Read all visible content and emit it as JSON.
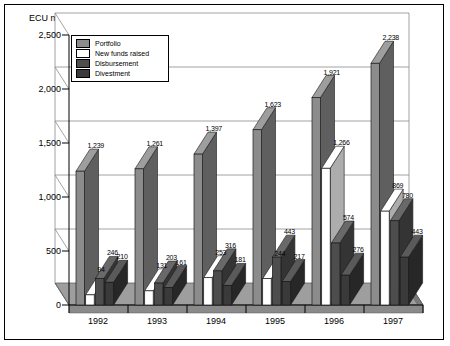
{
  "chart_data": {
    "type": "bar",
    "title": "",
    "ylabel": "ECU million",
    "xlabel": "",
    "categories": [
      "1992",
      "1993",
      "1994",
      "1995",
      "1996",
      "1997"
    ],
    "yticks": [
      "0",
      "500",
      "1,000",
      "1,500",
      "2,000",
      "2,500"
    ],
    "ytick_values": [
      0,
      500,
      1000,
      1500,
      2000,
      2500
    ],
    "ylim": [
      0,
      2500
    ],
    "grid": true,
    "legend_position": "top-left-inside",
    "style": "3d-grouped-bar",
    "series": [
      {
        "name": "Portfolio",
        "color": "#8c8c8c",
        "values": [
          1239,
          1261,
          1397,
          1623,
          1921,
          2238
        ],
        "labels": [
          "1,239",
          "1,261",
          "1,397",
          "1,623",
          "1,921",
          "2,238"
        ]
      },
      {
        "name": "New funds raised",
        "color": "#ffffff",
        "values": [
          94,
          131,
          253,
          244,
          1266,
          869
        ],
        "labels": [
          "94",
          "131",
          "253",
          "244",
          "1,266",
          "869"
        ]
      },
      {
        "name": "Disbursement",
        "color": "#4d4d4d",
        "values": [
          246,
          203,
          316,
          443,
          574,
          780
        ],
        "labels": [
          "246",
          "203",
          "316",
          "443",
          "574",
          "780"
        ]
      },
      {
        "name": "Divestment",
        "color": "#3a3a3a",
        "values": [
          210,
          161,
          181,
          217,
          276,
          443
        ],
        "labels": [
          "210",
          "161",
          "181",
          "217",
          "276",
          "443"
        ]
      }
    ]
  },
  "legend": {
    "items": [
      {
        "label": "Portfolio",
        "color": "#8c8c8c"
      },
      {
        "label": "New funds raised",
        "color": "#ffffff"
      },
      {
        "label": "Disbursement",
        "color": "#4d4d4d"
      },
      {
        "label": "Divestment",
        "color": "#3a3a3a"
      }
    ]
  },
  "colors": {
    "portfolio": "#8c8c8c",
    "new_funds_raised": "#ffffff",
    "disbursement": "#4d4d4d",
    "divestment": "#3a3a3a",
    "floor": "#9e9e9e",
    "grid": "#8c8c8c",
    "border": "#000000",
    "background": "#ffffff"
  }
}
